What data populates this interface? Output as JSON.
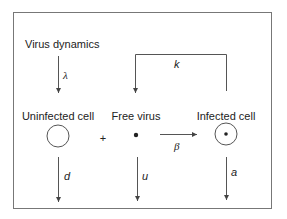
{
  "diagram": {
    "title": "Virus dynamics",
    "nodes": [
      {
        "id": "uninfected",
        "label": "Uninfected cell",
        "shape": "open-circle"
      },
      {
        "id": "free_virus",
        "label": "Free virus",
        "shape": "dot"
      },
      {
        "id": "infected",
        "label": "Infected cell",
        "shape": "circle-with-dot"
      }
    ],
    "operator": "+",
    "edges": [
      {
        "from": "source",
        "to": "uninfected",
        "label": "λ"
      },
      {
        "from": "free_virus",
        "to": "infected",
        "label": "β"
      },
      {
        "from": "infected",
        "to": "free_virus",
        "label": "k"
      },
      {
        "from": "uninfected",
        "to": "sink",
        "label": "d"
      },
      {
        "from": "free_virus",
        "to": "sink",
        "label": "u"
      },
      {
        "from": "infected",
        "to": "sink",
        "label": "a"
      }
    ],
    "colors": {
      "line": "#555555",
      "text": "#222222",
      "background": "#ffffff"
    }
  }
}
